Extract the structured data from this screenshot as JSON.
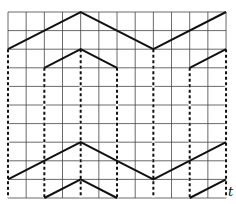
{
  "diagram": {
    "grid": {
      "x0": 8,
      "y0": 12,
      "cols": 12,
      "rows": 10,
      "cw": 18.17,
      "rh": 18.6,
      "color": "#444444"
    },
    "axis_label": "t",
    "polylines": [
      {
        "name": "top-wave-1",
        "points": [
          [
            0,
            2
          ],
          [
            4,
            0
          ],
          [
            8,
            2
          ],
          [
            12,
            0
          ]
        ]
      },
      {
        "name": "top-wave-2-a",
        "points": [
          [
            2,
            3
          ],
          [
            4,
            2
          ],
          [
            6,
            3
          ]
        ]
      },
      {
        "name": "top-wave-2-b",
        "points": [
          [
            10,
            3
          ],
          [
            12,
            2
          ]
        ]
      },
      {
        "name": "bottom-wave-1",
        "points": [
          [
            0,
            9
          ],
          [
            4,
            7
          ],
          [
            6,
            8
          ],
          [
            8,
            9
          ],
          [
            12,
            7
          ]
        ]
      },
      {
        "name": "bottom-wave-2-a",
        "points": [
          [
            2,
            10
          ],
          [
            4,
            9
          ],
          [
            6,
            10
          ]
        ]
      },
      {
        "name": "bottom-wave-2-b",
        "points": [
          [
            10,
            10
          ],
          [
            12,
            9
          ]
        ]
      }
    ],
    "dashed_verticals": [
      {
        "col": 0,
        "from": 2,
        "to": 10
      },
      {
        "col": 2,
        "from": 3,
        "to": 10
      },
      {
        "col": 4,
        "from": 2,
        "to": 10
      },
      {
        "col": 6,
        "from": 3,
        "to": 10
      },
      {
        "col": 8,
        "from": 2,
        "to": 10
      },
      {
        "col": 10,
        "from": 3,
        "to": 10
      },
      {
        "col": 12,
        "from": 2,
        "to": 10
      }
    ]
  }
}
